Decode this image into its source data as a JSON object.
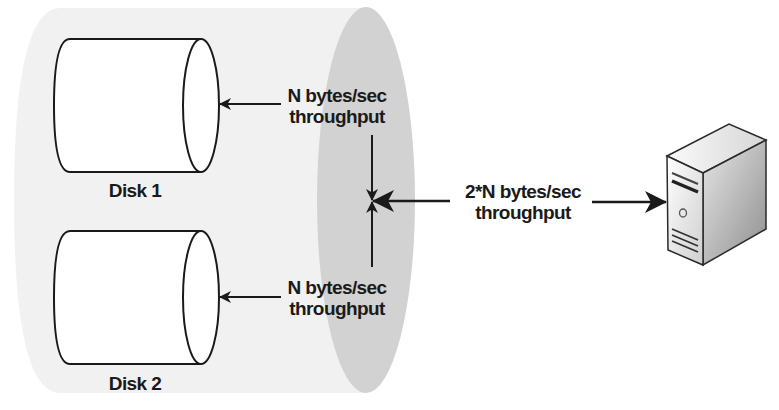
{
  "diagram": {
    "type": "storage-throughput-diagram",
    "colors": {
      "tube_body": "#f1f1f1",
      "tube_end": "#d2d2d2",
      "stroke": "#1a1a1a",
      "disk_fill": "#ffffff",
      "server_light": "#f4f4f4",
      "server_dark": "#9a9a9a"
    },
    "disks": [
      {
        "label": "Disk 1",
        "throughput_line1": "N bytes/sec",
        "throughput_line2": "throughput"
      },
      {
        "label": "Disk 2",
        "throughput_line1": "N bytes/sec",
        "throughput_line2": "throughput"
      }
    ],
    "combined": {
      "line1": "2*N bytes/sec",
      "line2": "throughput"
    },
    "server": {
      "icon": "server-tower-icon"
    },
    "connections": [
      {
        "from": "junction",
        "to": "Disk 1",
        "label": "N bytes/sec throughput"
      },
      {
        "from": "junction",
        "to": "Disk 2",
        "label": "N bytes/sec throughput"
      },
      {
        "from": "junction",
        "to": "server",
        "label": "2*N bytes/sec throughput"
      }
    ]
  }
}
